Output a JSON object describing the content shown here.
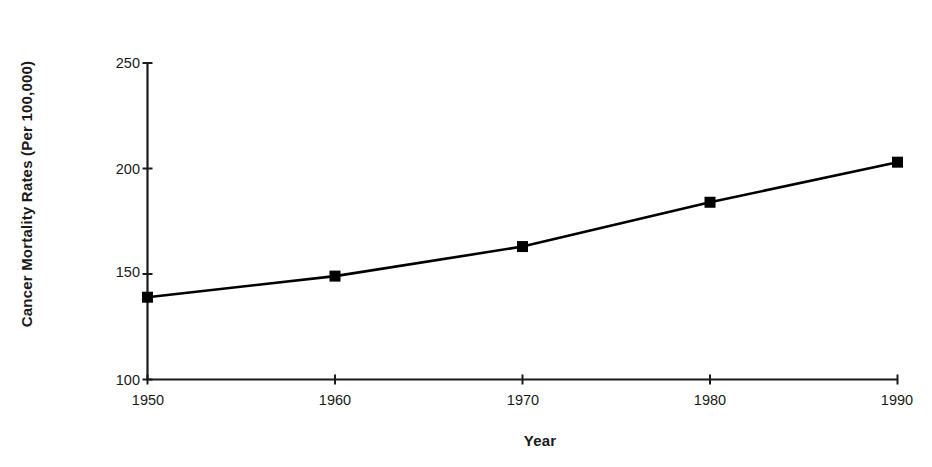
{
  "chart_data": {
    "type": "line",
    "title": "",
    "subtitle": "",
    "xlabel": "Year",
    "ylabel": "Cancer Mortality Rates (Per 100,000)",
    "x": [
      1950,
      1960,
      1970,
      1980,
      1990
    ],
    "categories": [
      "1950",
      "1960",
      "1970",
      "1980",
      "1990"
    ],
    "values": [
      139,
      149,
      163,
      184,
      203
    ],
    "series": [
      {
        "name": "Cancer Mortality Rate",
        "values": [
          139,
          149,
          163,
          184,
          203
        ],
        "marker": "filled-square",
        "color": "#000000",
        "line_color": "#000000"
      }
    ],
    "xlim": [
      1950,
      1990
    ],
    "ylim": [
      100,
      250
    ],
    "y_ticks": [
      100,
      150,
      200,
      250
    ],
    "y_tick_labels": [
      "100",
      "150",
      "200",
      "250"
    ],
    "x_ticks": [
      1950,
      1960,
      1970,
      1980,
      1990
    ],
    "x_tick_labels": [
      "1950",
      "1960",
      "1970",
      "1980",
      "1990"
    ],
    "grid": false,
    "legend": false,
    "legend_position": "none",
    "annotations": [],
    "background_color": "#ffffff",
    "axis_color": "#1a1a1a"
  },
  "axes": {
    "y_title": "Cancer Mortality Rates (Per 100,000)",
    "x_title": "Year",
    "y_labels": [
      "250",
      "200",
      "150",
      "100"
    ],
    "x_labels": [
      "1950",
      "1960",
      "1970",
      "1980",
      "1990"
    ]
  }
}
